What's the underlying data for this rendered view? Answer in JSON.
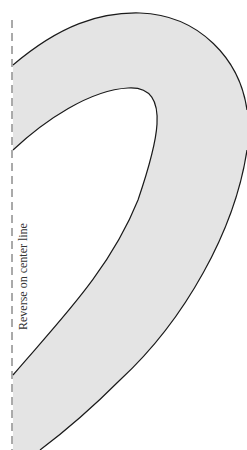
{
  "diagram": {
    "type": "sewing-pattern-piece",
    "center_line_label": "Reverse on center line",
    "colors": {
      "fill": "#e4e4e4",
      "stroke": "#1a1a1a",
      "center_line": "#555555",
      "background": "#ffffff"
    }
  }
}
